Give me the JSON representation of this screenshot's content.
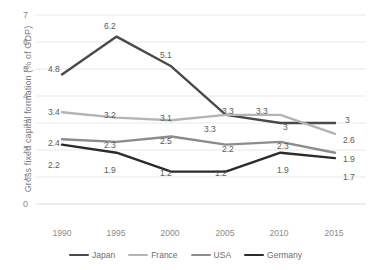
{
  "chart_data": {
    "type": "line",
    "title": "",
    "xlabel": "",
    "ylabel": "Gross fixed capital formation (% of GDP)",
    "categories": [
      "1990",
      "1995",
      "2000",
      "2005",
      "2010",
      "2015"
    ],
    "ylim": [
      0,
      7
    ],
    "yticks": [
      "0",
      "1",
      "2",
      "3",
      "4",
      "5",
      "6",
      "7"
    ],
    "grid": true,
    "legend_position": "bottom",
    "series": [
      {
        "name": "Japan",
        "color": "#4a4a4a",
        "values": [
          4.8,
          6.2,
          5.1,
          3.3,
          3.0,
          3.0
        ],
        "labels": [
          "4.8",
          "6.2",
          "5.1",
          "3.3",
          "3",
          "3"
        ]
      },
      {
        "name": "France",
        "color": "#b4b4b4",
        "values": [
          3.4,
          3.2,
          3.1,
          3.3,
          3.3,
          2.6
        ],
        "labels": [
          "3.4",
          "3.2",
          "3.1",
          "3.3",
          "3.3",
          "2.6"
        ]
      },
      {
        "name": "USA",
        "color": "#8c8c8c",
        "values": [
          2.4,
          2.3,
          2.5,
          2.2,
          2.3,
          1.9
        ],
        "labels": [
          "2.4",
          "2.3",
          "2.5",
          "2.2",
          "2.3",
          "1.9"
        ]
      },
      {
        "name": "Germany",
        "color": "#2b2b2b",
        "values": [
          2.2,
          1.9,
          1.2,
          1.2,
          1.9,
          1.7
        ],
        "labels": [
          "2.2",
          "1.9",
          "1.2",
          "1.2",
          "1.9",
          "1.7"
        ]
      }
    ]
  },
  "axis": {
    "y_label": "Gross fixed capital formation (% of GDP)",
    "y_ticks": [
      "7",
      "6",
      "5",
      "4",
      "3",
      "2",
      "1",
      "0"
    ],
    "x_ticks": [
      "1990",
      "1995",
      "2000",
      "2005",
      "2010",
      "2015"
    ]
  },
  "legend": {
    "items": [
      {
        "label": "Japan",
        "color": "#4a4a4a"
      },
      {
        "label": "France",
        "color": "#b4b4b4"
      },
      {
        "label": "USA",
        "color": "#8c8c8c"
      },
      {
        "label": "Germany",
        "color": "#2b2b2b"
      }
    ]
  },
  "data_labels": {
    "japan": [
      "4.8",
      "6.2",
      "5.1",
      "3.3",
      "3",
      "3"
    ],
    "france": [
      "3.4",
      "3.2",
      "3.1",
      "3.3",
      "3.3",
      "2.6"
    ],
    "usa": [
      "2.4",
      "2.3",
      "2.5",
      "2.2",
      "2.3",
      "1.9"
    ],
    "germany": [
      "2.2",
      "1.9",
      "1.2",
      "1.2",
      "1.9",
      "1.7"
    ]
  }
}
